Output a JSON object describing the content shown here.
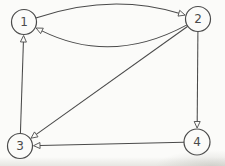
{
  "diagram": {
    "type": "directed-graph",
    "background": "#fbfbf9",
    "ink": "#4a4a4a",
    "node_fill": "#fbfbf9",
    "canvas": {
      "width": 225,
      "height": 166
    },
    "nodes": [
      {
        "id": "1",
        "label": "1",
        "x": 24,
        "y": 22,
        "r": 12.5
      },
      {
        "id": "2",
        "label": "2",
        "x": 198,
        "y": 19,
        "r": 12.5
      },
      {
        "id": "3",
        "label": "3",
        "x": 20,
        "y": 146,
        "r": 12.5
      },
      {
        "id": "4",
        "label": "4",
        "x": 197,
        "y": 142,
        "r": 13
      }
    ],
    "edges": [
      {
        "from": "1",
        "to": "2",
        "bend": -28
      },
      {
        "from": "2",
        "to": "1",
        "bend": -45
      },
      {
        "from": "2",
        "to": "3",
        "bend": 0
      },
      {
        "from": "2",
        "to": "4",
        "bend": 0
      },
      {
        "from": "4",
        "to": "3",
        "bend": 0
      },
      {
        "from": "3",
        "to": "1",
        "bend": 0
      }
    ],
    "arrow": {
      "length": 6.5,
      "half_width": 3,
      "gap": 1
    },
    "font_size": 12
  }
}
